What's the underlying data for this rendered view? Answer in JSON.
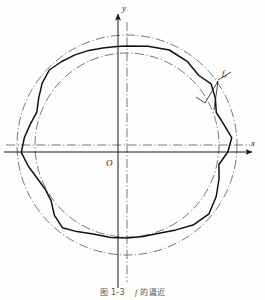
{
  "figure": {
    "caption_number": "图 1-3",
    "caption_symbol": "f",
    "caption_text": "的逼近",
    "axis_x_label": "x",
    "axis_y_label": "y",
    "origin_label": "O",
    "curve_label": "f",
    "curve_label_sub": "ε"
  },
  "colors": {
    "ink": "#1a1a1a",
    "curve": "#111111",
    "guide": "#4a4a4a",
    "background": "#fdfdfc"
  },
  "chart_data": {
    "type": "line",
    "xlabel": "x",
    "ylabel": "y",
    "center": [
      127,
      145
    ],
    "outer_circle_radius": 110,
    "inner_circle_radius": 92,
    "axis_x": {
      "y": 152,
      "x_start": 4,
      "x_end": 258
    },
    "axis_y": {
      "x": 118,
      "y_start": 288,
      "y_end": 10
    },
    "centerline_h_y": 145,
    "centerline_v_x": 127,
    "polygon_label_vertex": [
      218,
      81
    ],
    "polygon_vertices_deg_r": [
      [
        90,
        99
      ],
      [
        78,
        101
      ],
      [
        66,
        104
      ],
      [
        54,
        103
      ],
      [
        44,
        100
      ],
      [
        36,
        104
      ],
      [
        28,
        100
      ],
      [
        20,
        95
      ],
      [
        12,
        99
      ],
      [
        4,
        105
      ],
      [
        356,
        101
      ],
      [
        348,
        94
      ],
      [
        340,
        98
      ],
      [
        330,
        103
      ],
      [
        320,
        107
      ],
      [
        310,
        104
      ],
      [
        300,
        98
      ],
      [
        290,
        94
      ],
      [
        280,
        93
      ],
      [
        270,
        93
      ],
      [
        260,
        94
      ],
      [
        250,
        95
      ],
      [
        240,
        100
      ],
      [
        232,
        105
      ],
      [
        224,
        101
      ],
      [
        216,
        94
      ],
      [
        208,
        93
      ],
      [
        200,
        96
      ],
      [
        192,
        101
      ],
      [
        184,
        106
      ],
      [
        176,
        103
      ],
      [
        168,
        99
      ],
      [
        160,
        96
      ],
      [
        152,
        100
      ],
      [
        144,
        105
      ],
      [
        136,
        108
      ],
      [
        128,
        106
      ],
      [
        120,
        104
      ],
      [
        112,
        102
      ],
      [
        104,
        100
      ],
      [
        96,
        99
      ]
    ],
    "grid": false,
    "legend": "none"
  }
}
